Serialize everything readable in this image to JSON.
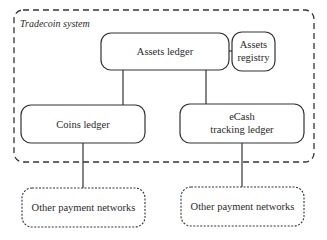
{
  "diagram": {
    "container": {
      "title": "Tradecoin system",
      "border_style": "dashed"
    },
    "nodes": {
      "assets_ledger": {
        "label": "Assets ledger"
      },
      "assets_registry": {
        "line1": "Assets",
        "line2": "registry"
      },
      "coins_ledger": {
        "label": "Coins ledger"
      },
      "ecash_tracking_ledger": {
        "line1": "eCash",
        "line2": "tracking ledger"
      },
      "other_networks_left": {
        "label": "Other payment networks",
        "border_style": "dotted"
      },
      "other_networks_right": {
        "label": "Other payment networks",
        "border_style": "dotted"
      }
    },
    "edges": [
      {
        "from": "assets_ledger",
        "to": "assets_registry"
      },
      {
        "from": "assets_ledger",
        "to": "coins_ledger"
      },
      {
        "from": "assets_ledger",
        "to": "ecash_tracking_ledger"
      },
      {
        "from": "coins_ledger",
        "to": "other_networks_left"
      },
      {
        "from": "ecash_tracking_ledger",
        "to": "other_networks_right"
      }
    ],
    "colors": {
      "stroke": "#333333",
      "text": "#2a2a2a",
      "background": "#ffffff"
    }
  }
}
